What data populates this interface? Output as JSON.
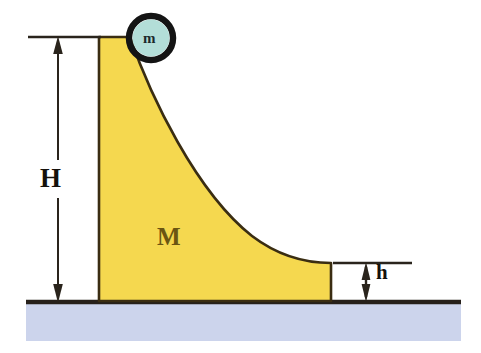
{
  "diagram": {
    "labels": {
      "ramp_mass": "M",
      "ball_mass": "m",
      "height_total": "H",
      "height_step": "h"
    },
    "colors": {
      "ramp_fill": "#f5d84f",
      "ramp_outline": "#3a2d12",
      "ball_fill": "#b3ded8",
      "ball_outline": "#141414",
      "ground_line": "#26201a",
      "ground_fill": "#ccd4ec",
      "dimension_line": "#2a241c",
      "label_M": "#6b5512",
      "label_text": "#15110c",
      "background": "#ffffff"
    },
    "geometry": {
      "ground_line_y": 302,
      "ground_left_x": 26,
      "ground_right_x": 461,
      "ground_band_bottom_y": 341,
      "ramp_left_x": 99,
      "ramp_top_y": 37,
      "ramp_top_right_x": 130,
      "ramp_bottom_y": 301,
      "ramp_right_x": 331,
      "plateau_top_y": 263,
      "ball_center_x": 151,
      "ball_center_y": 38,
      "ball_radius": 23,
      "ball_ring_width": 6,
      "H_arrow_x": 58,
      "H_top_y": 37,
      "H_bottom_y": 301,
      "H_ref_line_left_x": 28,
      "H_ref_line_right_x": 101,
      "h_arrow_x": 366,
      "h_top_y": 263,
      "h_bottom_y": 301,
      "h_ref_line_left_x": 333,
      "h_ref_line_right_x": 412
    }
  }
}
